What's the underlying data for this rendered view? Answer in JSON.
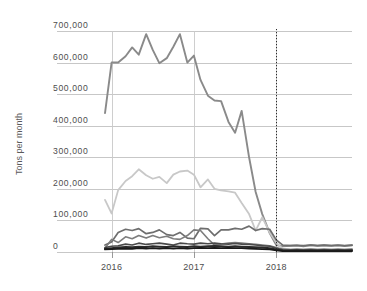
{
  "chart_data": {
    "type": "line",
    "title": "",
    "subtitle": "",
    "xlabel": "",
    "ylabel": "Tons per month",
    "ylim": [
      0,
      700000
    ],
    "xlim": [
      2015.92,
      2018.92
    ],
    "grid": true,
    "legend_position": "none",
    "y_ticks": [
      0,
      100000,
      200000,
      300000,
      400000,
      500000,
      600000,
      700000
    ],
    "y_tick_labels": [
      "0",
      "100,000",
      "200,000",
      "300,000",
      "400,000",
      "500,000",
      "600,000",
      "700,000"
    ],
    "x_ticks": [
      2016,
      2017,
      2018
    ],
    "x_tick_labels": [
      "2016",
      "2017",
      "2018"
    ],
    "annotations": [
      {
        "name": "vertical-dotted-marker",
        "type": "vline",
        "x": 2018,
        "style": "dotted",
        "color": "#2b2b2b"
      }
    ],
    "x": [
      2015.92,
      2016.0,
      2016.08,
      2016.17,
      2016.25,
      2016.33,
      2016.42,
      2016.5,
      2016.58,
      2016.67,
      2016.75,
      2016.83,
      2016.92,
      2017.0,
      2017.08,
      2017.17,
      2017.25,
      2017.33,
      2017.42,
      2017.5,
      2017.58,
      2017.67,
      2017.75,
      2017.83,
      2017.92,
      2018.0,
      2018.08,
      2018.17,
      2018.25,
      2018.33,
      2018.42,
      2018.5,
      2018.58,
      2018.67,
      2018.75,
      2018.83,
      2018.92
    ],
    "series": [
      {
        "name": "Series 1",
        "color": "#8a8a8a",
        "width": 1.9,
        "values": [
          440000,
          600000,
          600000,
          620000,
          648000,
          625000,
          690000,
          640000,
          598000,
          614000,
          650000,
          690000,
          600000,
          622000,
          545000,
          495000,
          480000,
          478000,
          412000,
          378000,
          447000,
          300000,
          190000,
          120000,
          60000,
          22000,
          18000,
          20000,
          21000,
          18000,
          22000,
          20000,
          22000,
          20000,
          21000,
          19000,
          22000
        ]
      },
      {
        "name": "Series 2",
        "color": "#c8c8c8",
        "width": 1.8,
        "values": [
          165000,
          122000,
          196000,
          225000,
          240000,
          262000,
          243000,
          232000,
          238000,
          218000,
          245000,
          255000,
          258000,
          245000,
          205000,
          230000,
          200000,
          195000,
          192000,
          188000,
          155000,
          120000,
          68000,
          110000,
          62000,
          30000,
          10000,
          8000,
          7000,
          8000,
          9000,
          8000,
          7000,
          8000,
          7000,
          8000,
          9000
        ]
      },
      {
        "name": "Series 3",
        "color": "#6e6e6e",
        "width": 1.7,
        "values": [
          22000,
          32000,
          62000,
          72000,
          68000,
          74000,
          58000,
          62000,
          70000,
          55000,
          52000,
          62000,
          44000,
          42000,
          75000,
          73000,
          52000,
          70000,
          70000,
          75000,
          72000,
          82000,
          68000,
          74000,
          72000,
          38000,
          22000,
          20000,
          21000,
          20000,
          22000,
          20000,
          21000,
          20000,
          22000,
          20000,
          21000
        ]
      },
      {
        "name": "Series 4",
        "color": "#7d7d7d",
        "width": 1.6,
        "values": [
          12000,
          40000,
          30000,
          48000,
          42000,
          52000,
          44000,
          52000,
          45000,
          50000,
          42000,
          40000,
          52000,
          70000,
          68000,
          42000,
          22000,
          25000,
          28000,
          30000,
          28000,
          26000,
          24000,
          22000,
          20000,
          14000,
          9000,
          8000,
          9000,
          8000,
          9000,
          8000,
          9000,
          8000,
          9000,
          8000,
          9000
        ]
      },
      {
        "name": "Series 5",
        "color": "#4a4a4a",
        "width": 1.6,
        "values": [
          14000,
          18000,
          20000,
          25000,
          22000,
          28000,
          24000,
          26000,
          28000,
          25000,
          22000,
          28000,
          26000,
          25000,
          28000,
          26000,
          28000,
          26000,
          25000,
          27000,
          25000,
          24000,
          22000,
          20000,
          18000,
          12000,
          7000,
          6000,
          7000,
          6000,
          7000,
          6000,
          7000,
          6000,
          7000,
          6000,
          7000
        ]
      },
      {
        "name": "Series 6",
        "color": "#2a2a2a",
        "width": 2.0,
        "values": [
          10000,
          12000,
          14000,
          16000,
          15000,
          17000,
          16000,
          18000,
          17000,
          16000,
          18000,
          17000,
          16000,
          18000,
          17000,
          18000,
          19000,
          18000,
          17000,
          18000,
          17000,
          16000,
          15000,
          14000,
          12000,
          8000,
          5000,
          4000,
          5000,
          4000,
          5000,
          4000,
          5000,
          4000,
          5000,
          4000,
          5000
        ]
      },
      {
        "name": "Series 7",
        "color": "#1a1a1a",
        "width": 1.8,
        "values": [
          8000,
          9000,
          10000,
          11000,
          10000,
          12000,
          11000,
          12000,
          11000,
          12000,
          11000,
          12000,
          11000,
          12000,
          13000,
          12000,
          13000,
          12000,
          13000,
          12000,
          12000,
          11000,
          10000,
          9000,
          8000,
          5000,
          3000,
          3000,
          3000,
          3000,
          3000,
          3000,
          3000,
          3000,
          3000,
          3000,
          3000
        ]
      }
    ]
  },
  "colors": {
    "gridline": "#b9b9b9",
    "axis_text": "#4d4d4d",
    "axis_title": "#5a5a5a",
    "background": "#ffffff",
    "marker_line": "#2b2b2b"
  }
}
